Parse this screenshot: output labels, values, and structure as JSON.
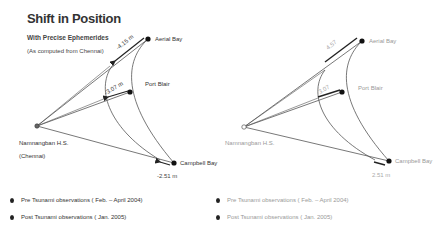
{
  "title": "Shift in Position",
  "subtitle": "With Precise Ephemerides",
  "subnote": "(As computed from Chennai)",
  "left_diagram": {
    "stations": [
      {
        "name": "Aerial Bay",
        "x": 148,
        "y": 39
      },
      {
        "name": "Port Blair",
        "x": 130,
        "y": 92
      },
      {
        "name": "Campbell Bay",
        "x": 174,
        "y": 163
      },
      {
        "name": "Namnangban H.S.",
        "name_line2": "(Chennai)",
        "x": 37,
        "y": 126
      }
    ],
    "shifts": [
      {
        "station": "Aerial Bay",
        "value": "-4.15 m"
      },
      {
        "station": "Port Blair",
        "value": "-3.07 m"
      },
      {
        "station": "Campbell Bay",
        "value": "-2.51 m"
      }
    ]
  },
  "right_diagram": {
    "stations": [
      {
        "name": "Aerial Bay",
        "x": 362,
        "y": 41
      },
      {
        "name": "Port Blair",
        "x": 342,
        "y": 92
      },
      {
        "name": "Campbell Bay",
        "x": 389,
        "y": 161
      },
      {
        "name": "Namnangban H.S.",
        "x": 244,
        "y": 127
      }
    ],
    "shifts": [
      {
        "station": "Aerial Bay",
        "value": "4.57"
      },
      {
        "station": "Port Blair",
        "value": "3.07"
      },
      {
        "station": "Campbell Bay",
        "value": "2.51 m"
      }
    ]
  },
  "legend": {
    "pre": "Pre Tsunami observations ( Feb. – April 2004)",
    "post": "Post Tsunami observations ( Jan. 2005)"
  },
  "colors": {
    "line": "#555555",
    "node": "#111111",
    "faint": "#999999"
  }
}
